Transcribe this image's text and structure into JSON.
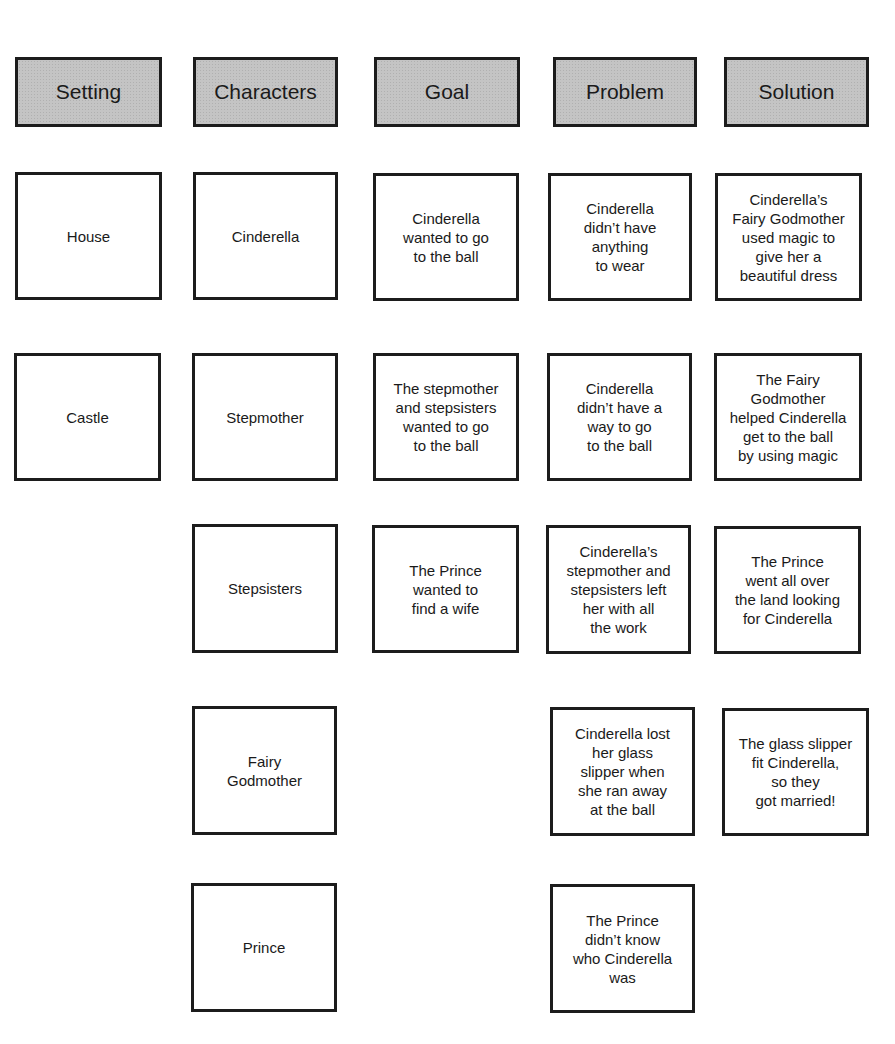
{
  "headers": {
    "setting": "Setting",
    "characters": "Characters",
    "goal": "Goal",
    "problem": "Problem",
    "solution": "Solution"
  },
  "setting": [
    "House",
    "Castle"
  ],
  "characters": [
    "Cinderella",
    "Stepmother",
    "Stepsisters",
    "Fairy\nGodmother",
    "Prince"
  ],
  "goal": [
    "Cinderella\nwanted to go\nto the ball",
    "The stepmother\nand stepsisters\nwanted to go\nto the ball",
    "The Prince\nwanted to\nfind a wife"
  ],
  "problem": [
    "Cinderella\ndidn’t have\nanything\nto wear",
    "Cinderella\ndidn’t have a\nway to go\nto the ball",
    "Cinderella’s\nstepmother and\nstepsisters left\nher with all\nthe work",
    "Cinderella lost\nher glass\nslipper when\nshe ran away\nat the ball",
    "The Prince\ndidn’t know\nwho Cinderella\nwas"
  ],
  "solution": [
    "Cinderella’s\nFairy Godmother\nused magic to\ngive her a\nbeautiful dress",
    "The Fairy\nGodmother\nhelped Cinderella\nget to the ball\nby using magic",
    "The Prince\nwent all over\nthe land looking\nfor Cinderella",
    "The glass slipper\nfit Cinderella,\nso they\ngot married!"
  ]
}
